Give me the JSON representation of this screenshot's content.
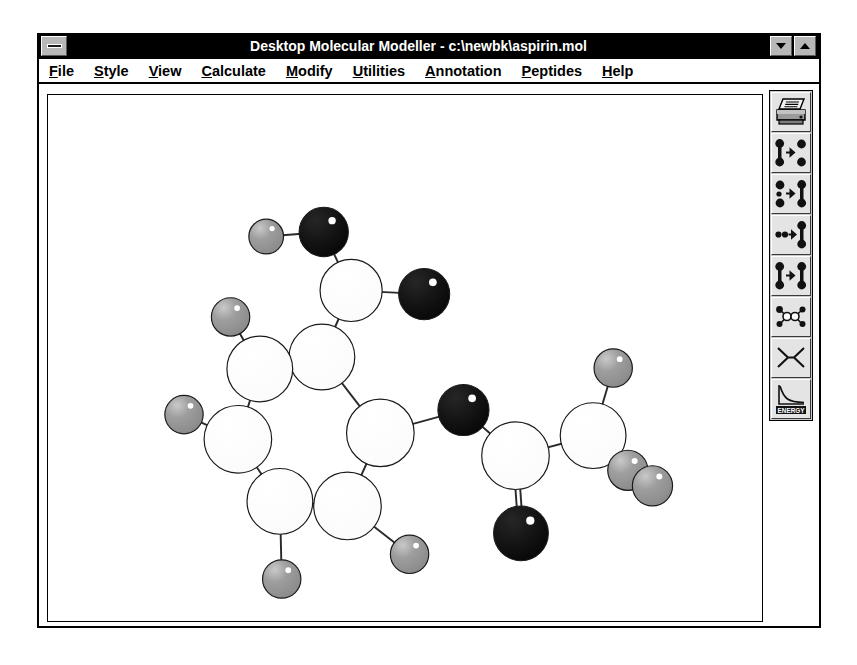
{
  "window": {
    "title": "Desktop Molecular Modeller - c:\\newbk\\aspirin.mol",
    "sysmenu_name": "system-menu",
    "minimize_label": "▼",
    "maximize_label": "▲"
  },
  "menu": {
    "items": [
      {
        "label": "File",
        "acc": "F",
        "rest": "ile"
      },
      {
        "label": "Style",
        "acc": "S",
        "rest": "tyle"
      },
      {
        "label": "View",
        "acc": "V",
        "rest": "iew"
      },
      {
        "label": "Calculate",
        "acc": "C",
        "rest": "alculate"
      },
      {
        "label": "Modify",
        "acc": "M",
        "rest": "odify"
      },
      {
        "label": "Utilities",
        "acc": "U",
        "rest": "tilities"
      },
      {
        "label": "Annotation",
        "acc": "A",
        "rest": "nnotation"
      },
      {
        "label": "Peptides",
        "acc": "P",
        "rest": "eptides"
      },
      {
        "label": "Help",
        "acc": "H",
        "rest": "elp"
      }
    ]
  },
  "toolbar": {
    "buttons": [
      {
        "icon": "printer-icon",
        "label": "Print"
      },
      {
        "icon": "break-bond-icon",
        "label": "Break Bond"
      },
      {
        "icon": "make-bond-icon",
        "label": "Make Bond"
      },
      {
        "icon": "join-atoms-icon",
        "label": "Join Atoms"
      },
      {
        "icon": "bond-to-bond-icon",
        "label": "Bond to Bond"
      },
      {
        "icon": "fragment-icon",
        "label": "Fragment"
      },
      {
        "icon": "cross-flip-icon",
        "label": "Flip"
      },
      {
        "icon": "energy-plot-icon",
        "label": "ENERGY"
      }
    ],
    "energy_caption": "ENERGY"
  },
  "colors": {
    "carbon": "#ffffff",
    "oxygen": "#111111",
    "hydrogen": "#9a9a9a",
    "outline": "#1a1a1a",
    "bond": "#2a2a2a",
    "title_bar": "#000000",
    "face": "#c0c0c0",
    "canvas_bg": "#ffffff"
  },
  "molecule": {
    "name": "aspirin",
    "file": "c:\\newbk\\aspirin.mol",
    "formula": "C9H8O4",
    "style": "ball-and-stick",
    "atoms": [
      {
        "id": "H1",
        "element": "H",
        "x": 205,
        "y": 155,
        "r": 19
      },
      {
        "id": "O1",
        "element": "O",
        "x": 268,
        "y": 150,
        "r": 27
      },
      {
        "id": "C1",
        "element": "C",
        "x": 298,
        "y": 214,
        "r": 34
      },
      {
        "id": "O2",
        "element": "O",
        "x": 378,
        "y": 218,
        "r": 28
      },
      {
        "id": "C2",
        "element": "C",
        "x": 266,
        "y": 287,
        "r": 36
      },
      {
        "id": "H2",
        "element": "H",
        "x": 166,
        "y": 243,
        "r": 21
      },
      {
        "id": "C3",
        "element": "C",
        "x": 198,
        "y": 300,
        "r": 36
      },
      {
        "id": "H3",
        "element": "H",
        "x": 115,
        "y": 350,
        "r": 21
      },
      {
        "id": "C4",
        "element": "C",
        "x": 174,
        "y": 377,
        "r": 37
      },
      {
        "id": "C5",
        "element": "C",
        "x": 220,
        "y": 445,
        "r": 36
      },
      {
        "id": "H4",
        "element": "H",
        "x": 222,
        "y": 530,
        "r": 21
      },
      {
        "id": "C6",
        "element": "C",
        "x": 294,
        "y": 450,
        "r": 37
      },
      {
        "id": "H5",
        "element": "H",
        "x": 362,
        "y": 503,
        "r": 21
      },
      {
        "id": "C7",
        "element": "C",
        "x": 330,
        "y": 370,
        "r": 37
      },
      {
        "id": "O3",
        "element": "O",
        "x": 421,
        "y": 345,
        "r": 28
      },
      {
        "id": "C8",
        "element": "C",
        "x": 478,
        "y": 395,
        "r": 37
      },
      {
        "id": "O4",
        "element": "O",
        "x": 484,
        "y": 480,
        "r": 30
      },
      {
        "id": "C9",
        "element": "C",
        "x": 563,
        "y": 373,
        "r": 36
      },
      {
        "id": "H6",
        "element": "H",
        "x": 585,
        "y": 299,
        "r": 21
      },
      {
        "id": "H7",
        "element": "H",
        "x": 601,
        "y": 411,
        "r": 22
      },
      {
        "id": "H8",
        "element": "H",
        "x": 628,
        "y": 428,
        "r": 22
      }
    ],
    "bonds": [
      {
        "a": "H1",
        "b": "O1",
        "order": 1
      },
      {
        "a": "O1",
        "b": "C1",
        "order": 1
      },
      {
        "a": "C1",
        "b": "O2",
        "order": 1
      },
      {
        "a": "C1",
        "b": "C2",
        "order": 1
      },
      {
        "a": "C2",
        "b": "C3",
        "order": 1
      },
      {
        "a": "C3",
        "b": "H2",
        "order": 1
      },
      {
        "a": "C3",
        "b": "C4",
        "order": 1
      },
      {
        "a": "C4",
        "b": "H3",
        "order": 1
      },
      {
        "a": "C4",
        "b": "C5",
        "order": 1
      },
      {
        "a": "C5",
        "b": "H4",
        "order": 1
      },
      {
        "a": "C5",
        "b": "C6",
        "order": 1
      },
      {
        "a": "C6",
        "b": "H5",
        "order": 1
      },
      {
        "a": "C6",
        "b": "C7",
        "order": 1
      },
      {
        "a": "C7",
        "b": "C2",
        "order": 1
      },
      {
        "a": "C7",
        "b": "O3",
        "order": 1
      },
      {
        "a": "O3",
        "b": "C8",
        "order": 1
      },
      {
        "a": "C8",
        "b": "O4",
        "order": 2
      },
      {
        "a": "C8",
        "b": "C9",
        "order": 1
      },
      {
        "a": "C9",
        "b": "H6",
        "order": 1
      },
      {
        "a": "C9",
        "b": "H7",
        "order": 1
      },
      {
        "a": "C9",
        "b": "H8",
        "order": 1
      }
    ]
  }
}
